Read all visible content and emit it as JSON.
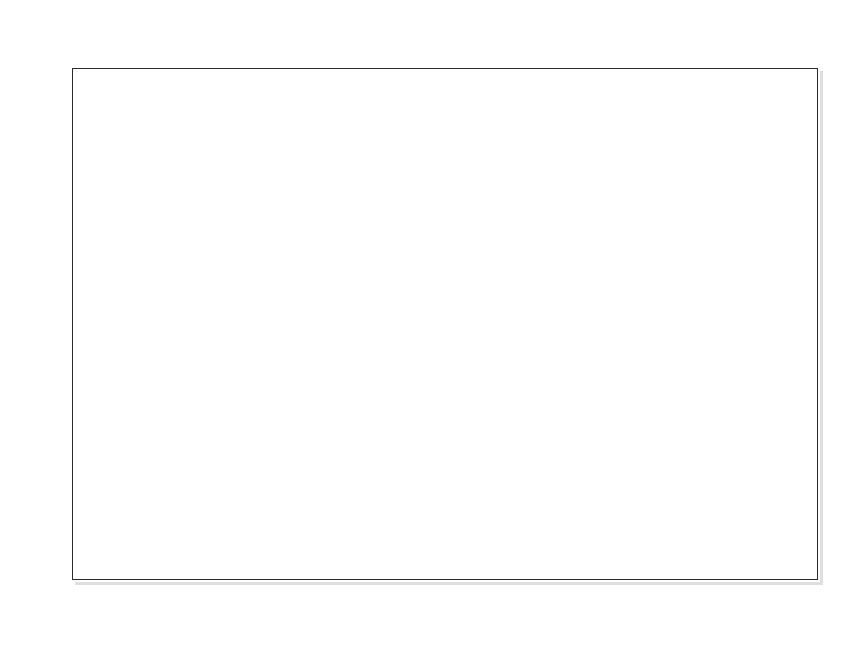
{
  "artifact": {
    "clipped_top_line": "survey of retailers employed in the organizing of retail space"
  },
  "chart_data": {
    "type": "bar",
    "xlabel": "",
    "ylabel": "",
    "ylim": [
      0,
      100
    ],
    "grid": false,
    "legend": "none",
    "y_tick_labels": [
      "100%",
      "90%",
      "80%",
      "70%",
      "60%",
      "50%",
      "40%",
      "30%",
      "20%",
      "10%",
      "0%"
    ],
    "y_ticks": [
      100,
      90,
      80,
      70,
      60,
      50,
      40,
      30,
      20,
      10,
      0
    ],
    "categories": [
      "Combination\nlayout",
      "Free\nflow",
      "Space allocated\non model\nstock plan",
      "Gridiron",
      "Loop",
      "Space allocated\nbased on\nproductivity\nratios",
      "Other*"
    ],
    "category_lines": [
      [
        "Combination",
        "layout"
      ],
      [
        "Free",
        "flow"
      ],
      [
        "Space allocated",
        "on model",
        "stock plan"
      ],
      [
        "Gridiron"
      ],
      [
        "Loop"
      ],
      [
        "Space allocated",
        "based on",
        "productivity",
        "ratios"
      ],
      [
        "Other*"
      ]
    ],
    "values": [
      51,
      40,
      30,
      23,
      15,
      15,
      3
    ],
    "value_labels": [
      "51%",
      "40%",
      "30%",
      "23%",
      "15%",
      "15%",
      "3%"
    ],
    "bar_color": "#3a3a3a",
    "frame_color": "#2b2b2b",
    "background_color": "#ffffff"
  },
  "geometry": {
    "plot_left": 72,
    "plot_right": 818,
    "plot_top": 68,
    "plot_bottom": 580,
    "bar_x": [
      105,
      211,
      312,
      415,
      520,
      624,
      735
    ],
    "bar_width": [
      75,
      70,
      73,
      73,
      71,
      69,
      60
    ],
    "label_x": [
      68,
      182,
      280,
      400,
      490,
      588,
      714
    ],
    "label_width": [
      150,
      128,
      166,
      118,
      116,
      170,
      110
    ]
  }
}
